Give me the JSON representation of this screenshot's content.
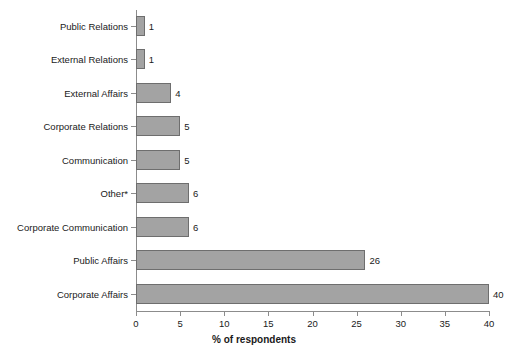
{
  "chart_data": {
    "type": "bar",
    "orientation": "horizontal",
    "title": "",
    "xlabel": "% of respondents",
    "ylabel": "",
    "xlim": [
      0,
      40
    ],
    "xticks": [
      0,
      5,
      10,
      15,
      20,
      25,
      30,
      35,
      40
    ],
    "grid": false,
    "legend": null,
    "bar_color": "#a3a3a3",
    "bar_border_color": "#6e6e6e",
    "categories": [
      "Public Relations",
      "External Relations",
      "External Affairs",
      "Corporate Relations",
      "Communication",
      "Other*",
      "Corporate Communication",
      "Public Affairs",
      "Corporate Affairs"
    ],
    "values": [
      1,
      1,
      4,
      5,
      5,
      6,
      6,
      26,
      40
    ],
    "value_labels": [
      "1",
      "1",
      "4",
      "5",
      "5",
      "6",
      "6",
      "26",
      "40"
    ]
  }
}
